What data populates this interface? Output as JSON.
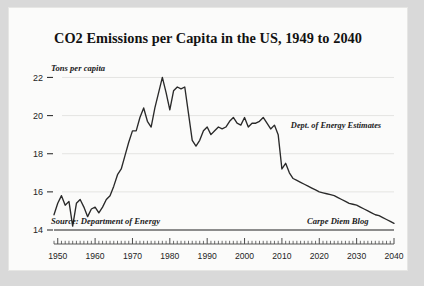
{
  "chart_data": {
    "type": "line",
    "title": "CO2 Emissions per Capita in the US, 1949 to 2040",
    "xlabel": "",
    "ylabel": "Tons per capita",
    "ylim": [
      14,
      22.6
    ],
    "xlim": [
      1949,
      2040
    ],
    "yticks": [
      14,
      16,
      18,
      20,
      22
    ],
    "xticks": [
      1950,
      1960,
      1970,
      1980,
      1990,
      2000,
      2010,
      2020,
      2030,
      2040
    ],
    "grid": "horizontal",
    "legend": "none",
    "annotations": [
      {
        "name": "y-axis-note",
        "text": "Tons per capita"
      },
      {
        "name": "source-note",
        "text": "Source: Department of Energy"
      },
      {
        "name": "blog-note",
        "text": "Carpe Diem Blog"
      },
      {
        "name": "estimates-note",
        "text": "Dept. of Energy Estimates"
      }
    ],
    "series": [
      {
        "name": "CO2 emissions per capita",
        "color": "#2a2a2a",
        "x": [
          1949,
          1950,
          1951,
          1952,
          1953,
          1954,
          1955,
          1956,
          1957,
          1958,
          1959,
          1960,
          1961,
          1962,
          1963,
          1964,
          1965,
          1966,
          1967,
          1968,
          1969,
          1970,
          1971,
          1972,
          1973,
          1974,
          1975,
          1976,
          1977,
          1978,
          1979,
          1980,
          1981,
          1982,
          1983,
          1984,
          1985,
          1986,
          1987,
          1988,
          1989,
          1990,
          1991,
          1992,
          1993,
          1994,
          1995,
          1996,
          1997,
          1998,
          1999,
          2000,
          2001,
          2002,
          2003,
          2004,
          2005,
          2006,
          2007,
          2008,
          2009,
          2010,
          2011,
          2012,
          2013,
          2014,
          2015,
          2016,
          2017,
          2018,
          2019,
          2020,
          2021,
          2022,
          2023,
          2024,
          2025,
          2026,
          2027,
          2028,
          2029,
          2030,
          2031,
          2032,
          2033,
          2034,
          2035,
          2036,
          2037,
          2038,
          2039,
          2040
        ],
        "values": [
          14.8,
          15.4,
          15.8,
          15.3,
          15.5,
          14.2,
          15.4,
          15.6,
          15.2,
          14.7,
          15.1,
          15.2,
          14.9,
          15.2,
          15.6,
          15.8,
          16.3,
          16.9,
          17.2,
          17.9,
          18.6,
          19.2,
          19.2,
          19.9,
          20.4,
          19.7,
          19.4,
          20.4,
          21.2,
          22.0,
          21.2,
          20.3,
          21.3,
          21.5,
          21.4,
          21.5,
          20.1,
          18.7,
          18.4,
          18.7,
          19.2,
          19.4,
          19.0,
          19.2,
          19.4,
          19.3,
          19.4,
          19.7,
          19.9,
          19.6,
          19.5,
          19.9,
          19.4,
          19.6,
          19.6,
          19.7,
          19.9,
          19.6,
          19.3,
          19.5,
          19.0,
          17.2,
          17.5,
          17.0,
          16.7,
          16.6,
          16.5,
          16.4,
          16.3,
          16.2,
          16.1,
          16.0,
          15.95,
          15.9,
          15.85,
          15.8,
          15.7,
          15.6,
          15.5,
          15.4,
          15.35,
          15.3,
          15.2,
          15.1,
          15.0,
          14.9,
          14.8,
          14.75,
          14.65,
          14.55,
          14.45,
          14.35
        ]
      }
    ]
  }
}
